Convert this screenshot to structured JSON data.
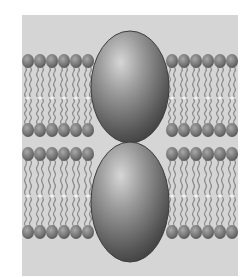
{
  "diagram": {
    "labels": [],
    "colors": {
      "page_background": "#ffffff",
      "panel_background": "#d5d5d5",
      "lipid_head": "#7a7a7a",
      "lipid_tail": "#8c8c8c",
      "protein_light": "#bdbdbd",
      "protein_dark": "#3e3e3e",
      "midline_dot": "#f2f2f2"
    },
    "panel": {
      "x": 22,
      "y": 15,
      "width": 216,
      "height": 261
    },
    "bilayers": [
      {
        "name": "upper-membrane",
        "top_head_y": 61,
        "midline_y": 98,
        "bottom_head_y": 130
      },
      {
        "name": "lower-membrane",
        "top_head_y": 154,
        "midline_y": 196,
        "bottom_head_y": 232
      }
    ],
    "proteins": [
      {
        "name": "upper-protein",
        "cx": 130,
        "cy": 87,
        "rx": 39,
        "ry": 56
      },
      {
        "name": "lower-protein",
        "cx": 130,
        "cy": 202,
        "rx": 39,
        "ry": 60
      }
    ],
    "lipid_head_radius": 6,
    "lipid_head_spacing": 12,
    "left_lipid_x_range": [
      28,
      88
    ],
    "right_lipid_x_range": [
      172,
      232
    ]
  }
}
